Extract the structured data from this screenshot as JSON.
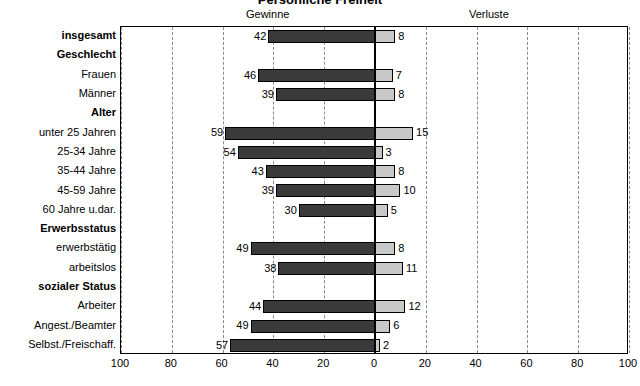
{
  "chart": {
    "title": "Persönliche Freiheit",
    "headers": {
      "gains": "Gewinne",
      "losses": "Verluste"
    }
  },
  "chart_data": {
    "type": "bar",
    "orientation": "horizontal-diverging",
    "title": "Persönliche Freiheit",
    "xlabel": "",
    "ylabel": "",
    "xlim": [
      -100,
      100
    ],
    "xticks": [
      100,
      80,
      60,
      40,
      20,
      0,
      20,
      40,
      60,
      80,
      100
    ],
    "grid": true,
    "legend_position": "top",
    "series": [
      {
        "name": "Gewinne",
        "color": "#3a3a3a",
        "direction": "left"
      },
      {
        "name": "Verluste",
        "color": "#c8c8c8",
        "direction": "right"
      }
    ],
    "rows": [
      {
        "label": "insgesamt",
        "group": true,
        "gains": 42,
        "losses": 8
      },
      {
        "label": "Geschlecht",
        "group": true,
        "gains": null,
        "losses": null
      },
      {
        "label": "Frauen",
        "group": false,
        "gains": 46,
        "losses": 7
      },
      {
        "label": "Männer",
        "group": false,
        "gains": 39,
        "losses": 8
      },
      {
        "label": "Alter",
        "group": true,
        "gains": null,
        "losses": null
      },
      {
        "label": "unter 25 Jahren",
        "group": false,
        "gains": 59,
        "losses": 15
      },
      {
        "label": "25-34 Jahre",
        "group": false,
        "gains": 54,
        "losses": 3
      },
      {
        "label": "35-44 Jahre",
        "group": false,
        "gains": 43,
        "losses": 8
      },
      {
        "label": "45-59 Jahre",
        "group": false,
        "gains": 39,
        "losses": 10
      },
      {
        "label": "60 Jahre u.dar.",
        "group": false,
        "gains": 30,
        "losses": 5
      },
      {
        "label": "Erwerbsstatus",
        "group": true,
        "gains": null,
        "losses": null
      },
      {
        "label": "erwerbstätig",
        "group": false,
        "gains": 49,
        "losses": 8
      },
      {
        "label": "arbeitslos",
        "group": false,
        "gains": 38,
        "losses": 11
      },
      {
        "label": "sozialer Status",
        "group": true,
        "gains": null,
        "losses": null
      },
      {
        "label": "Arbeiter",
        "group": false,
        "gains": 44,
        "losses": 12
      },
      {
        "label": "Angest./Beamter",
        "group": false,
        "gains": 49,
        "losses": 6
      },
      {
        "label": "Selbst./Freischaff.",
        "group": false,
        "gains": 57,
        "losses": 2
      }
    ]
  }
}
